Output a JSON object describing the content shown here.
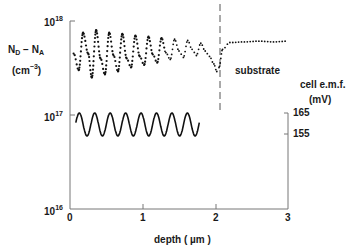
{
  "chart_data": {
    "type": "line",
    "title": "",
    "xlabel": "depth (µm)",
    "ylabel": "N_D - N_A (cm^-3)",
    "ylabel_right": "cell e.m.f. (mV)",
    "xlim": [
      0,
      3
    ],
    "ylim": [
      1e+16,
      1e+18
    ],
    "yscale": "log",
    "x_ticks": [
      "0",
      "1",
      "2",
      "3"
    ],
    "y_ticks": [
      "10^16",
      "10^17",
      "10^18"
    ],
    "y_right_ticks": [
      "165",
      "155"
    ],
    "grid": false,
    "legend": null,
    "annotations": [
      {
        "text": "substrate",
        "x": 2.2,
        "y": 3e+17
      },
      {
        "type": "dashed-vline",
        "x": 2.05
      }
    ],
    "series": [
      {
        "name": "N_D - N_A (dotted profile)",
        "style": "dotted",
        "x": [
          0.05,
          0.12,
          0.18,
          0.25,
          0.3,
          0.36,
          0.42,
          0.48,
          0.54,
          0.6,
          0.66,
          0.72,
          0.78,
          0.84,
          0.9,
          0.96,
          1.02,
          1.08,
          1.14,
          1.2,
          1.26,
          1.32,
          1.38,
          1.44,
          1.5,
          1.56,
          1.62,
          1.68,
          1.74,
          1.8,
          1.86,
          1.92,
          1.98,
          2.02,
          2.05,
          2.1,
          2.2,
          2.4,
          2.6,
          2.8,
          3.0
        ],
        "values": [
          4.5e+17,
          3e+17,
          7.5e+17,
          4.5e+17,
          2.5e+17,
          8e+17,
          4e+17,
          2.7e+17,
          7.5e+17,
          4.3e+17,
          2.9e+17,
          7.3e+17,
          4e+17,
          3.2e+17,
          7e+17,
          4.2e+17,
          3.4e+17,
          6.8e+17,
          4.4e+17,
          3.6e+17,
          6.6e+17,
          4.6e+17,
          3.9e+17,
          6.4e+17,
          4.8e+17,
          4.1e+17,
          6.2e+17,
          5e+17,
          4.3e+17,
          5.8e+17,
          4.8e+17,
          4.2e+17,
          3.5e+17,
          2.9e+17,
          3.2e+17,
          5e+17,
          5.9e+17,
          6e+17,
          6.1e+17,
          6e+17,
          6.1e+17
        ]
      },
      {
        "name": "cell e.m.f. (mV)",
        "style": "solid",
        "axis": "right",
        "x_range": [
          0.08,
          1.78
        ],
        "cycles": 8,
        "min_mv": 155,
        "max_mv": 165
      }
    ]
  },
  "labels": {
    "y_label_line1_main": "N",
    "y_label_line1_sub1": "D",
    "y_label_line1_mid": " − N",
    "y_label_line1_sub2": "A",
    "y_label_line2_pre": "(cm",
    "y_label_line2_sup": "−3",
    "y_label_line2_post": ")",
    "tick_base": "10",
    "tick_exp_18": "18",
    "tick_exp_17": "17",
    "tick_exp_16": "16",
    "x_tick_0": "0",
    "x_tick_1": "1",
    "x_tick_2": "2",
    "x_tick_3": "3",
    "x_axis_title": "depth ( µm )",
    "right_title_line1": "cell  e.m.f.",
    "right_title_line2": "(mV)",
    "right_tick_165": "165",
    "right_tick_155": "155",
    "substrate": "substrate"
  }
}
